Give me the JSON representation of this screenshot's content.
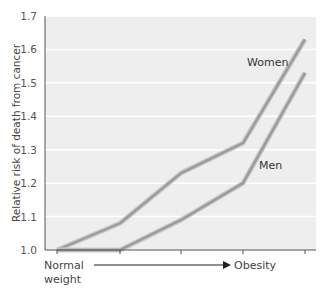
{
  "chart_data": {
    "type": "line",
    "title": "",
    "xlabel": "",
    "ylabel": "Relative risk of death from cancer",
    "x": [
      1,
      2,
      3,
      4,
      5
    ],
    "x_axis": {
      "start_label_line1": "Normal",
      "start_label_line2": "weight",
      "end_label": "Obesity",
      "arrow": true
    },
    "yticks": [
      "1.0",
      "1.1",
      "1.2",
      "1.3",
      "1.4",
      "1.5",
      "1.6",
      "1.7"
    ],
    "ylim": [
      1.0,
      1.7
    ],
    "grid": true,
    "series": [
      {
        "name": "Women",
        "values": [
          1.0,
          1.08,
          1.23,
          1.32,
          1.63
        ]
      },
      {
        "name": "Men",
        "values": [
          1.0,
          1.0,
          1.09,
          1.2,
          1.53
        ]
      }
    ],
    "legend": "inline labels"
  },
  "colors": {
    "plot_bg": "#eeeeee",
    "grid": "#ffffff",
    "line_outer": "#c9c9c9",
    "line_inner": "#9b9b9b",
    "axis": "#555555"
  }
}
